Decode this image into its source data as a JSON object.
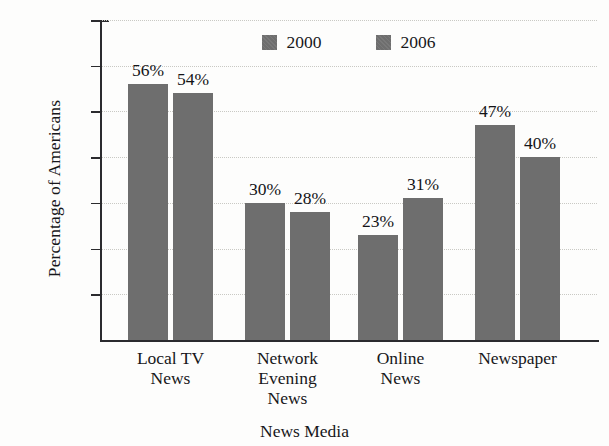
{
  "chart_data": {
    "type": "bar",
    "title": "",
    "xlabel": "News Media",
    "ylabel": "Percentage of Americans",
    "categories": [
      "Local TV News",
      "Network Evening News",
      "Online News",
      "Newspaper"
    ],
    "category_lines": [
      [
        "Local TV",
        "News"
      ],
      [
        "Network",
        "Evening",
        "News"
      ],
      [
        "Online",
        "News"
      ],
      [
        "Newspaper"
      ]
    ],
    "series": [
      {
        "name": "2000",
        "values": [
          56,
          30,
          23,
          47
        ],
        "color": "#6e6e6e"
      },
      {
        "name": "2006",
        "values": [
          54,
          28,
          31,
          40
        ],
        "color": "#6e6e6e"
      }
    ],
    "value_labels": [
      [
        "56%",
        "54%"
      ],
      [
        "30%",
        "28%"
      ],
      [
        "23%",
        "31%"
      ],
      [
        "47%",
        "40%"
      ]
    ],
    "ylim": [
      0,
      70
    ],
    "ytick_values": [
      10,
      20,
      30,
      40,
      50,
      60,
      70
    ],
    "ytick_labels": [
      "10%",
      "20%",
      "30%",
      "40%",
      "50%",
      "60%",
      "70%"
    ],
    "grid": true,
    "grid_style": "dotted",
    "legend_position": "top-center",
    "legend": [
      "2000",
      "2006"
    ],
    "units": "percent"
  },
  "axes": {
    "y_title": "Percentage of Americans",
    "x_title": "News Media"
  },
  "legend": {
    "entries": [
      {
        "label": "2000",
        "swatch": "legend-swatch-2000"
      },
      {
        "label": "2006",
        "swatch": "legend-swatch-2006"
      }
    ]
  }
}
